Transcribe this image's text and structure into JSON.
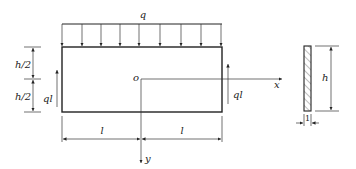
{
  "diagram": {
    "type": "beam-loading-figure",
    "labels": {
      "distributed_load": "q",
      "left_shear": "ql",
      "right_shear": "ql",
      "origin": "o",
      "x_axis": "x",
      "y_axis": "y",
      "half_height_top": "h/2",
      "half_height_bottom": "h/2",
      "length_left": "l",
      "length_right": "l",
      "section_height": "h",
      "section_width": "1"
    },
    "load_arrow_count": 9,
    "colors": {
      "line": "#222222",
      "background": "#ffffff"
    }
  }
}
